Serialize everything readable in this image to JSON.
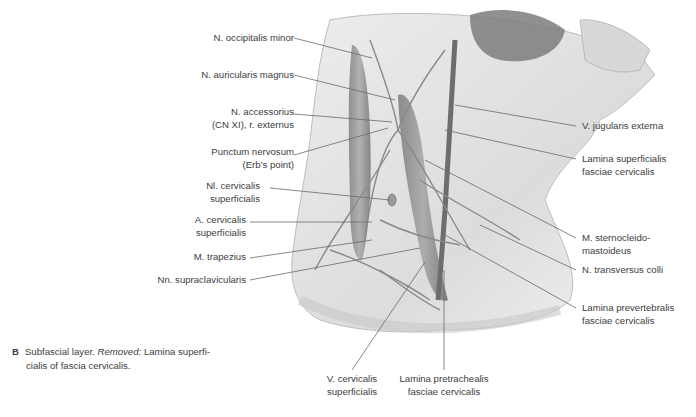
{
  "figure": {
    "letter": "B",
    "caption_part1": "Subfascial layer.",
    "caption_removed": "Removed:",
    "caption_part2": "Lamina superfi-",
    "caption_line2": "cialis of fascia cervicalis."
  },
  "labels_left": [
    {
      "id": "n-occipitalis-minor",
      "lines": [
        "N. occipitalis minor"
      ]
    },
    {
      "id": "n-auricularis-magnus",
      "lines": [
        "N. auricularis magnus"
      ]
    },
    {
      "id": "n-accessorius",
      "lines": [
        "N. accessorius",
        "(CN XI), r. externus"
      ]
    },
    {
      "id": "punctum-nervosum",
      "lines": [
        "Punctum nervosum",
        "(Erb’s point)"
      ]
    },
    {
      "id": "nl-cervicalis-superficialis",
      "lines": [
        "Nl. cervicalis",
        "superficialis"
      ]
    },
    {
      "id": "a-cervicalis-superficialis",
      "lines": [
        "A. cervicalis",
        "superficialis"
      ]
    },
    {
      "id": "m-trapezius",
      "lines": [
        "M. trapezius"
      ]
    },
    {
      "id": "nn-supraclavicularis",
      "lines": [
        "Nn. supraclavicularis"
      ]
    }
  ],
  "labels_right": [
    {
      "id": "v-jugularis-externa",
      "lines": [
        "V. jugularis externa"
      ]
    },
    {
      "id": "lamina-superficialis",
      "lines": [
        "Lamina superficialis",
        "fasciae cervicalis"
      ]
    },
    {
      "id": "m-sternocleidomastoideus",
      "lines": [
        "M. sternocleido-",
        "mastoideus"
      ]
    },
    {
      "id": "n-transversus-colli",
      "lines": [
        "N. transversus colli"
      ]
    },
    {
      "id": "lamina-prevertebralis",
      "lines": [
        "Lamina prevertebralis",
        "fasciae cervicalis"
      ]
    }
  ],
  "labels_bottom": [
    {
      "id": "v-cervicalis-superficialis",
      "lines": [
        "V. cervicalis",
        "superficialis"
      ]
    },
    {
      "id": "lamina-pretrachealis",
      "lines": [
        "Lamina pretrachealis",
        "fasciae cervicalis"
      ]
    }
  ],
  "colors": {
    "text": "#3d3d3d",
    "leader": "#6a6a6a",
    "skin": "#e6e6e6",
    "muscle": "#8c8c8c"
  }
}
